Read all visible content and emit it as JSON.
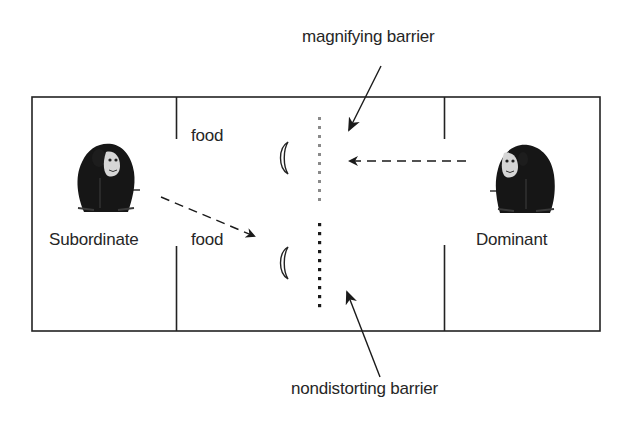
{
  "diagram": {
    "labels": {
      "magnifying_barrier": "magnifying barrier",
      "nondistorting_barrier": "nondistorting barrier",
      "food_top": "food",
      "food_bottom": "food",
      "subordinate": "Subordinate",
      "dominant": "Dominant"
    },
    "rooms": [
      "Subordinate room",
      "Center room",
      "Dominant room"
    ],
    "barriers": [
      {
        "name": "magnifying barrier",
        "style": "gray dotted"
      },
      {
        "name": "nondistorting barrier",
        "style": "black dotted"
      }
    ],
    "lenses": 2,
    "colors": {
      "line": "#222222",
      "magnifying_barrier": "#8a8a8a",
      "nondistorting_barrier": "#1a1a1a",
      "chimp_fur": "#161616",
      "chimp_face": "#d8d8d8"
    }
  }
}
